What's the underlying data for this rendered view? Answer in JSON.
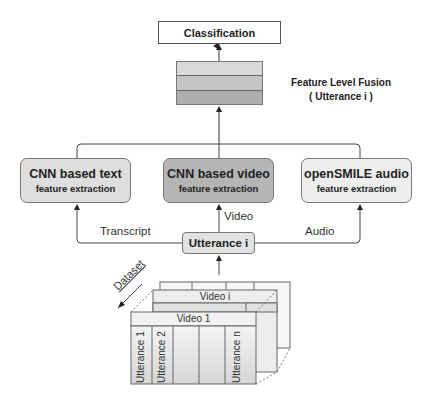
{
  "diagram": {
    "classification": {
      "label": "Classification"
    },
    "fusion": {
      "title": "Feature Level Fusion",
      "subtitle": "( Utterance i )",
      "band_colors": [
        "#d9d9d9",
        "#c4c4c4",
        "#aeaeae"
      ]
    },
    "extractors": [
      {
        "title": "CNN based text",
        "subtitle": "feature extraction",
        "fill": "#dedede"
      },
      {
        "title": "CNN based video",
        "subtitle": "feature extraction",
        "fill": "#b5b5b5"
      },
      {
        "title": "openSMILE audio",
        "subtitle": "feature extraction",
        "fill": "#eeeeee"
      }
    ],
    "edges": {
      "transcript": "Transcript",
      "video": "Video",
      "audio": "Audio"
    },
    "utterance": {
      "label": "Utterance i"
    },
    "dataset": {
      "label": "Dataset",
      "front_video": "Video 1",
      "middle_video": "Video i",
      "utterances": [
        "Utterance 1",
        "Utterance 2",
        "",
        "",
        "Utterance n"
      ]
    }
  }
}
